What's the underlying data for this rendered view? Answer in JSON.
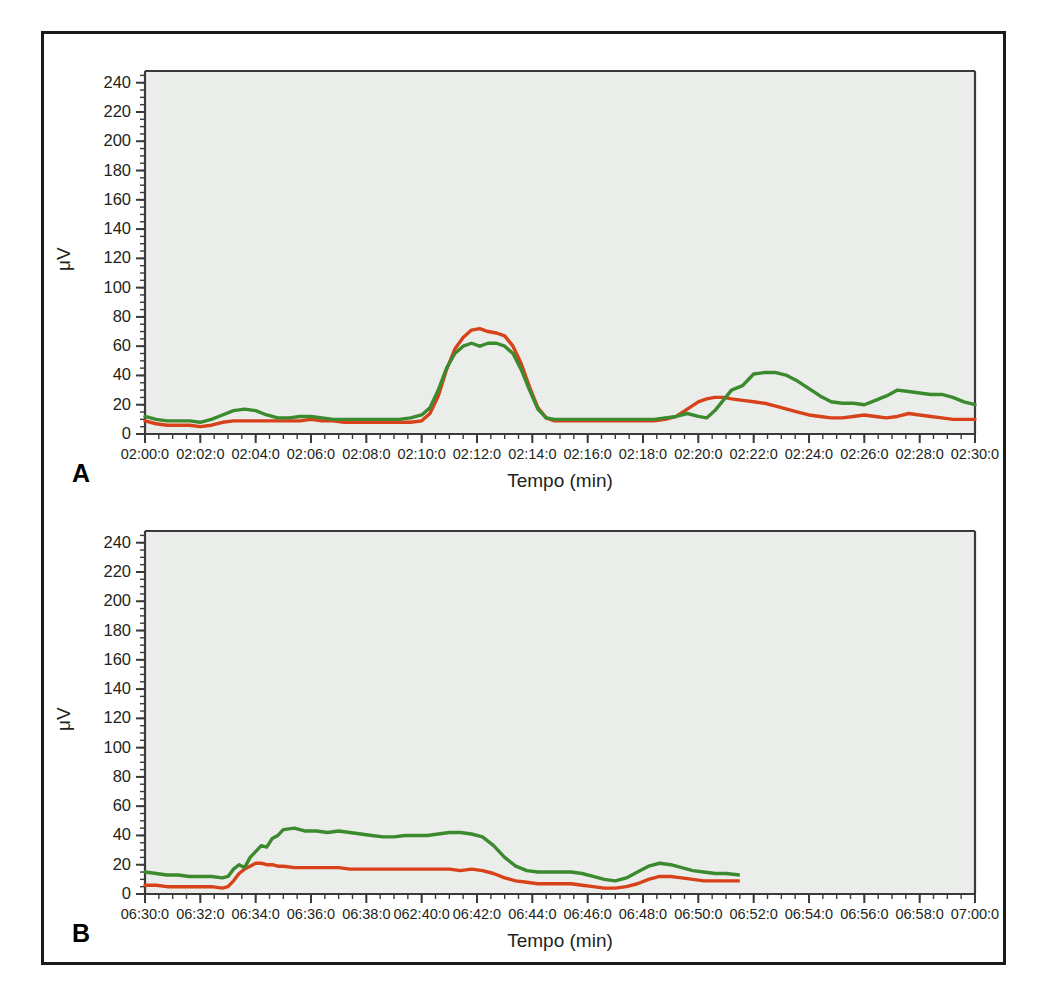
{
  "figure": {
    "panels": [
      {
        "letter": "A",
        "xlabel": "Tempo (min)",
        "ylabel": "μV"
      },
      {
        "letter": "B",
        "xlabel": "Tempo (min)",
        "ylabel": "μV"
      }
    ]
  },
  "colors": {
    "series_red": "#d8421b",
    "series_green": "#3c8a2e",
    "plot_background": "#e8ebe8",
    "axis": "#3a3a3a",
    "frame": "#1a1a1a",
    "text": "#231f20"
  },
  "chart_data": [
    {
      "type": "line",
      "panel": "A",
      "title": "",
      "xlabel": "Tempo (min)",
      "ylabel": "μV",
      "ylim": [
        0,
        248
      ],
      "yticks": [
        0,
        20,
        40,
        60,
        80,
        100,
        120,
        140,
        160,
        180,
        200,
        220,
        240
      ],
      "ytick_labels": [
        "0",
        "20",
        "40",
        "60",
        "80",
        "100",
        "120",
        "140",
        "160",
        "180",
        "200",
        "220",
        "240"
      ],
      "y_minor_step": 5,
      "xlim": [
        120,
        150
      ],
      "xticks": [
        120,
        122,
        124,
        126,
        128,
        130,
        132,
        134,
        136,
        138,
        140,
        142,
        144,
        146,
        148,
        150
      ],
      "xtick_labels": [
        "02:00:0",
        "02:02:0",
        "02:04:0",
        "02:06:0",
        "02:08:0",
        "02:10:0",
        "02:12:0",
        "02:14:0",
        "02:16:0",
        "02:18:0",
        "02:20:0",
        "02:22:0",
        "02:24:0",
        "02:26:0",
        "02:28:0",
        "02:30:0"
      ],
      "x_minor_step": 0.5,
      "grid": false,
      "legend": "none",
      "x": [
        120.0,
        120.4,
        120.8,
        121.2,
        121.6,
        122.0,
        122.4,
        122.8,
        123.2,
        123.6,
        124.0,
        124.4,
        124.8,
        125.2,
        125.6,
        126.0,
        126.4,
        126.8,
        127.2,
        127.6,
        128.0,
        128.4,
        128.8,
        129.2,
        129.6,
        130.0,
        130.3,
        130.6,
        130.9,
        131.2,
        131.5,
        131.8,
        132.1,
        132.4,
        132.7,
        133.0,
        133.3,
        133.6,
        133.9,
        134.2,
        134.5,
        134.8,
        135.2,
        135.6,
        136.0,
        136.5,
        137.0,
        137.5,
        138.0,
        138.4,
        138.8,
        139.2,
        139.6,
        140.0,
        140.3,
        140.6,
        140.9,
        141.2,
        141.6,
        142.0,
        142.4,
        142.8,
        143.2,
        143.6,
        144.0,
        144.4,
        144.8,
        145.2,
        145.6,
        146.0,
        146.4,
        146.8,
        147.2,
        147.6,
        148.0,
        148.4,
        148.8,
        149.2,
        149.6,
        150.0
      ],
      "series": [
        {
          "name": "red",
          "color": "#d8421b",
          "values": [
            9,
            7,
            6,
            6,
            6,
            5,
            6,
            8,
            9,
            9,
            9,
            9,
            9,
            9,
            9,
            10,
            9,
            9,
            8,
            8,
            8,
            8,
            8,
            8,
            8,
            9,
            14,
            26,
            44,
            58,
            66,
            71,
            72,
            70,
            69,
            67,
            60,
            48,
            32,
            18,
            11,
            9,
            9,
            9,
            9,
            9,
            9,
            9,
            9,
            9,
            10,
            12,
            17,
            22,
            24,
            25,
            25,
            24,
            23,
            22,
            21,
            19,
            17,
            15,
            13,
            12,
            11,
            11,
            12,
            13,
            12,
            11,
            12,
            14,
            13,
            12,
            11,
            10,
            10,
            10
          ]
        },
        {
          "name": "green",
          "color": "#3c8a2e",
          "values": [
            12,
            10,
            9,
            9,
            9,
            8,
            10,
            13,
            16,
            17,
            16,
            13,
            11,
            11,
            12,
            12,
            11,
            10,
            10,
            10,
            10,
            10,
            10,
            10,
            11,
            13,
            18,
            30,
            45,
            55,
            60,
            62,
            60,
            62,
            62,
            60,
            55,
            44,
            30,
            17,
            11,
            10,
            10,
            10,
            10,
            10,
            10,
            10,
            10,
            10,
            11,
            12,
            14,
            12,
            11,
            16,
            23,
            30,
            33,
            41,
            42,
            42,
            40,
            36,
            31,
            26,
            22,
            21,
            21,
            20,
            23,
            26,
            30,
            29,
            28,
            27,
            27,
            25,
            22,
            20
          ]
        }
      ]
    },
    {
      "type": "line",
      "panel": "B",
      "title": "",
      "xlabel": "Tempo (min)",
      "ylabel": "μV",
      "ylim": [
        0,
        248
      ],
      "yticks": [
        0,
        20,
        40,
        60,
        80,
        100,
        120,
        140,
        160,
        180,
        200,
        220,
        240
      ],
      "ytick_labels": [
        "0",
        "20",
        "40",
        "60",
        "80",
        "100",
        "120",
        "140",
        "160",
        "180",
        "200",
        "220",
        "240"
      ],
      "y_minor_step": 5,
      "xlim": [
        390,
        420
      ],
      "xticks": [
        390,
        392,
        394,
        396,
        398,
        400,
        402,
        404,
        406,
        408,
        410,
        412,
        414,
        416,
        418,
        420
      ],
      "xtick_labels": [
        "06:30:0",
        "06:32:0",
        "06:34:0",
        "06:36:0",
        "06:38:0",
        "062:40:0",
        "06:42:0",
        "06:44:0",
        "06:46:0",
        "06:48:0",
        "06:50:0",
        "06:52:0",
        "06:54:0",
        "06:56:0",
        "06:58:0",
        "07:00:0"
      ],
      "x_minor_step": 0.5,
      "grid": false,
      "legend": "none",
      "data_end_x": 411.5,
      "x": [
        390.0,
        390.4,
        390.8,
        391.2,
        391.6,
        392.0,
        392.4,
        392.8,
        393.0,
        393.2,
        393.4,
        393.6,
        393.8,
        394.0,
        394.2,
        394.4,
        394.6,
        394.8,
        395.0,
        395.4,
        395.8,
        396.2,
        396.6,
        397.0,
        397.4,
        397.8,
        398.2,
        398.6,
        399.0,
        399.4,
        399.8,
        400.2,
        400.6,
        401.0,
        401.4,
        401.8,
        402.2,
        402.6,
        403.0,
        403.4,
        403.8,
        404.2,
        404.6,
        405.0,
        405.4,
        405.8,
        406.2,
        406.6,
        407.0,
        407.4,
        407.8,
        408.2,
        408.6,
        409.0,
        409.4,
        409.8,
        410.2,
        410.6,
        411.0,
        411.5
      ],
      "series": [
        {
          "name": "red",
          "color": "#d8421b",
          "values": [
            6,
            6,
            5,
            5,
            5,
            5,
            5,
            4,
            5,
            9,
            14,
            17,
            19,
            21,
            21,
            20,
            20,
            19,
            19,
            18,
            18,
            18,
            18,
            18,
            17,
            17,
            17,
            17,
            17,
            17,
            17,
            17,
            17,
            17,
            16,
            17,
            16,
            14,
            11,
            9,
            8,
            7,
            7,
            7,
            7,
            6,
            5,
            4,
            4,
            5,
            7,
            10,
            12,
            12,
            11,
            10,
            9,
            9,
            9,
            9
          ]
        },
        {
          "name": "green",
          "color": "#3c8a2e",
          "values": [
            15,
            14,
            13,
            13,
            12,
            12,
            12,
            11,
            12,
            17,
            20,
            18,
            25,
            29,
            33,
            32,
            38,
            40,
            44,
            45,
            43,
            43,
            42,
            43,
            42,
            41,
            40,
            39,
            39,
            40,
            40,
            40,
            41,
            42,
            42,
            41,
            39,
            33,
            25,
            19,
            16,
            15,
            15,
            15,
            15,
            14,
            12,
            10,
            9,
            11,
            15,
            19,
            21,
            20,
            18,
            16,
            15,
            14,
            14,
            13
          ]
        }
      ]
    }
  ]
}
